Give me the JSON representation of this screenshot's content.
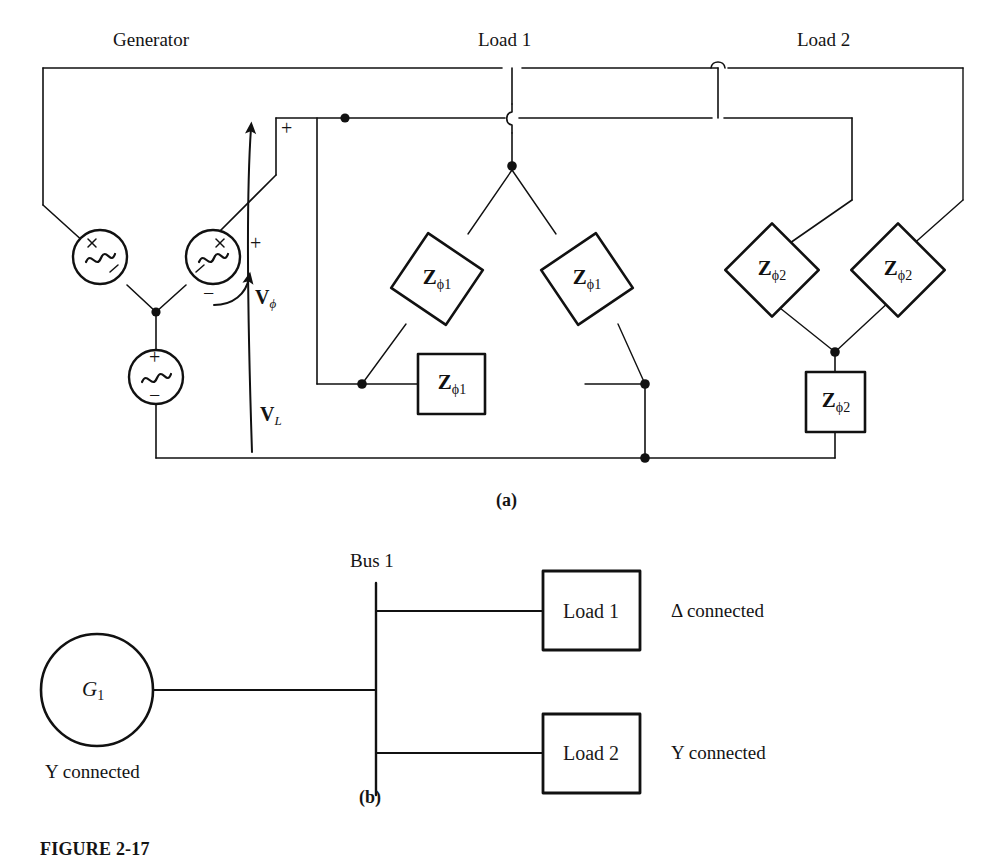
{
  "figure": {
    "number": "FIGURE 2-17",
    "caption_a": "(a)",
    "caption_b": "(b)"
  },
  "diagram_a": {
    "section_labels": {
      "generator": "Generator",
      "load1": "Load 1",
      "load2": "Load 2"
    },
    "generator": {
      "type": "Y-connected three-phase AC source",
      "source_symbol": "ac-sine",
      "phase_voltage_label": "V",
      "phase_voltage_sub": "ϕ",
      "line_voltage_label": "V",
      "line_voltage_sub": "L",
      "polarity_plus": "+",
      "polarity_minus": "−",
      "top_terminal_plus": "+"
    },
    "load1": {
      "connection": "delta",
      "impedance_label": "Z",
      "impedance_sub": "ϕ1",
      "impedance_count": 3,
      "elements": [
        {
          "label": "Z",
          "sub": "ϕ1",
          "shape": "diamond",
          "position": "left"
        },
        {
          "label": "Z",
          "sub": "ϕ1",
          "shape": "diamond",
          "position": "right"
        },
        {
          "label": "Z",
          "sub": "ϕ1",
          "shape": "rectangle",
          "position": "bottom"
        }
      ]
    },
    "load2": {
      "connection": "wye",
      "impedance_label": "Z",
      "impedance_sub": "ϕ2",
      "impedance_count": 3,
      "elements": [
        {
          "label": "Z",
          "sub": "ϕ2",
          "shape": "diamond",
          "position": "left"
        },
        {
          "label": "Z",
          "sub": "ϕ2",
          "shape": "diamond",
          "position": "right"
        },
        {
          "label": "Z",
          "sub": "ϕ2",
          "shape": "rectangle",
          "position": "bottom"
        }
      ]
    }
  },
  "diagram_b": {
    "bus_label": "Bus 1",
    "generator": {
      "symbol_label": "G",
      "symbol_sub": "1",
      "connection_note": "Y connected"
    },
    "branches": [
      {
        "box_label": "Load 1",
        "connection_note": "Δ connected"
      },
      {
        "box_label": "Load 2",
        "connection_note": "Y connected"
      }
    ]
  }
}
